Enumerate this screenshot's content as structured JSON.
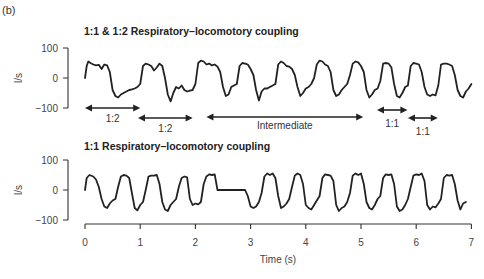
{
  "figure": {
    "panel_label": "(b)",
    "x_axis": {
      "label": "Time (s)",
      "ticks": [
        "0",
        "1",
        "2",
        "3",
        "4",
        "5",
        "6",
        "7"
      ],
      "range": [
        0,
        7
      ]
    }
  },
  "chart_data": [
    {
      "type": "line",
      "title": "1:1 & 1:2 Respiratory–locomotory coupling",
      "xlabel": "",
      "ylabel": "l/s",
      "xlim": [
        0,
        7
      ],
      "ylim": [
        -100,
        100
      ],
      "yticks": [
        "100",
        "0",
        "−100"
      ],
      "grid": false,
      "series": [
        {
          "name": "airflow",
          "x": [
            0.0,
            0.03,
            0.06,
            0.1,
            0.15,
            0.2,
            0.25,
            0.3,
            0.35,
            0.4,
            0.45,
            0.5,
            0.55,
            0.6,
            0.65,
            0.7,
            0.75,
            0.8,
            0.85,
            0.9,
            0.95,
            1.0,
            1.05,
            1.1,
            1.15,
            1.2,
            1.25,
            1.3,
            1.35,
            1.4,
            1.45,
            1.5,
            1.55,
            1.6,
            1.65,
            1.7,
            1.75,
            1.8,
            1.85,
            1.9,
            1.95,
            2.0,
            2.05,
            2.1,
            2.15,
            2.2,
            2.25,
            2.3,
            2.35,
            2.4,
            2.45,
            2.5,
            2.55,
            2.6,
            2.65,
            2.7,
            2.75,
            2.8,
            2.85,
            2.9,
            2.95,
            3.0,
            3.05,
            3.1,
            3.15,
            3.2,
            3.25,
            3.3,
            3.35,
            3.4,
            3.45,
            3.5,
            3.55,
            3.6,
            3.65,
            3.7,
            3.75,
            3.8,
            3.85,
            3.9,
            3.95,
            4.0,
            4.05,
            4.1,
            4.15,
            4.2,
            4.25,
            4.3,
            4.35,
            4.4,
            4.45,
            4.5,
            4.55,
            4.6,
            4.65,
            4.7,
            4.75,
            4.8,
            4.85,
            4.9,
            4.95,
            5.0,
            5.05,
            5.1,
            5.15,
            5.2,
            5.25,
            5.3,
            5.35,
            5.4,
            5.45,
            5.5,
            5.55,
            5.6,
            5.65,
            5.7,
            5.75,
            5.8,
            5.85,
            5.9,
            5.95,
            6.0,
            6.05,
            6.1,
            6.15,
            6.2,
            6.25,
            6.3,
            6.35,
            6.4,
            6.45,
            6.5,
            6.55,
            6.6,
            6.65,
            6.7,
            6.75,
            6.8,
            6.85,
            6.9,
            6.95,
            7.0
          ],
          "values": [
            0,
            40,
            55,
            50,
            45,
            42,
            44,
            30,
            45,
            42,
            20,
            -40,
            -60,
            -65,
            -55,
            -50,
            -45,
            -40,
            -38,
            -35,
            -30,
            -20,
            40,
            48,
            45,
            40,
            25,
            35,
            48,
            40,
            0,
            -55,
            -78,
            -50,
            -30,
            -35,
            -25,
            -40,
            -45,
            -42,
            -40,
            -20,
            50,
            58,
            55,
            45,
            48,
            42,
            45,
            38,
            20,
            -30,
            -60,
            -55,
            -30,
            -25,
            -20,
            40,
            50,
            48,
            45,
            30,
            10,
            -40,
            -75,
            -45,
            -35,
            -35,
            -30,
            -25,
            -20,
            45,
            55,
            50,
            40,
            38,
            30,
            10,
            -30,
            -60,
            -50,
            -35,
            -30,
            -20,
            0,
            45,
            58,
            55,
            45,
            40,
            20,
            -40,
            -60,
            -55,
            -40,
            -30,
            -20,
            10,
            48,
            55,
            52,
            40,
            20,
            -40,
            -65,
            -55,
            -40,
            -35,
            -10,
            48,
            50,
            48,
            35,
            -20,
            -60,
            -65,
            -50,
            -30,
            -25,
            40,
            50,
            48,
            45,
            20,
            -30,
            -55,
            -60,
            -55,
            -58,
            -25,
            45,
            48,
            48,
            45,
            40,
            10,
            -40,
            -60,
            -65,
            -45,
            -35,
            -20,
            45,
            55
          ]
        }
      ],
      "annotations": [
        {
          "label": "1:2",
          "x_start": 0.0,
          "x_end": 1.0
        },
        {
          "label": "1:2",
          "x_start": 0.96,
          "x_end": 1.95
        },
        {
          "label": "Intermediate",
          "x_start": 2.2,
          "x_end": 5.04
        },
        {
          "label": "1:1",
          "x_start": 5.29,
          "x_end": 5.84
        },
        {
          "label": "1:1",
          "x_start": 5.85,
          "x_end": 6.39
        }
      ]
    },
    {
      "type": "line",
      "title": "1:1 Respiratory–locomotory coupling",
      "xlabel": "Time (s)",
      "ylabel": "l/s",
      "xlim": [
        0,
        7
      ],
      "ylim": [
        -100,
        100
      ],
      "yticks": [
        "100",
        "0",
        "−100"
      ],
      "xticks": [
        "0",
        "1",
        "2",
        "3",
        "4",
        "5",
        "6",
        "7"
      ],
      "grid": false,
      "series": [
        {
          "name": "airflow",
          "x": [
            0.0,
            0.03,
            0.08,
            0.15,
            0.2,
            0.25,
            0.3,
            0.35,
            0.4,
            0.45,
            0.5,
            0.55,
            0.6,
            0.65,
            0.7,
            0.75,
            0.8,
            0.85,
            0.9,
            0.95,
            1.0,
            1.05,
            1.1,
            1.15,
            1.2,
            1.25,
            1.3,
            1.35,
            1.4,
            1.45,
            1.5,
            1.55,
            1.6,
            1.65,
            1.7,
            1.75,
            1.8,
            1.85,
            1.9,
            1.95,
            2.0,
            2.05,
            2.1,
            2.15,
            2.2,
            2.25,
            2.3,
            2.35,
            2.4,
            2.45,
            2.5,
            2.6,
            2.7,
            2.8,
            2.9,
            2.95,
            3.0,
            3.05,
            3.1,
            3.15,
            3.2,
            3.25,
            3.3,
            3.35,
            3.4,
            3.45,
            3.5,
            3.55,
            3.6,
            3.65,
            3.7,
            3.75,
            3.8,
            3.85,
            3.9,
            3.95,
            4.0,
            4.05,
            4.1,
            4.15,
            4.2,
            4.25,
            4.3,
            4.35,
            4.4,
            4.45,
            4.5,
            4.55,
            4.6,
            4.65,
            4.7,
            4.75,
            4.8,
            4.85,
            4.9,
            4.95,
            5.0,
            5.05,
            5.1,
            5.15,
            5.2,
            5.25,
            5.3,
            5.35,
            5.4,
            5.45,
            5.5,
            5.55,
            5.6,
            5.65,
            5.7,
            5.75,
            5.8,
            5.85,
            5.9,
            5.95,
            6.0,
            6.05,
            6.1,
            6.15,
            6.2,
            6.25,
            6.3,
            6.35,
            6.4,
            6.45,
            6.5,
            6.55,
            6.6,
            6.65,
            6.7,
            6.75,
            6.8,
            6.85,
            6.9,
            6.95
          ],
          "values": [
            0,
            40,
            50,
            45,
            35,
            10,
            -30,
            -55,
            -60,
            -45,
            -35,
            -30,
            10,
            45,
            50,
            48,
            40,
            -10,
            -60,
            -68,
            -50,
            -40,
            0,
            45,
            48,
            48,
            50,
            20,
            -40,
            -65,
            -70,
            -50,
            -40,
            -30,
            10,
            40,
            45,
            42,
            -30,
            -50,
            -45,
            -48,
            -40,
            20,
            45,
            52,
            50,
            52,
            0,
            0,
            0,
            0,
            0,
            0,
            0,
            -20,
            -55,
            -60,
            -55,
            -40,
            -10,
            45,
            55,
            50,
            55,
            40,
            -20,
            -60,
            -55,
            -45,
            -30,
            10,
            48,
            55,
            50,
            20,
            -50,
            -60,
            -65,
            -50,
            -35,
            -20,
            40,
            52,
            50,
            48,
            30,
            -50,
            -70,
            -60,
            -55,
            -40,
            -10,
            48,
            55,
            50,
            55,
            20,
            -40,
            -60,
            -65,
            -50,
            -30,
            -20,
            40,
            52,
            50,
            52,
            20,
            -55,
            -70,
            -65,
            -50,
            -30,
            10,
            48,
            52,
            50,
            55,
            30,
            -50,
            -65,
            -55,
            -58,
            -45,
            -30,
            40,
            50,
            48,
            50,
            20,
            -35,
            -65,
            -45,
            -40
          ]
        }
      ]
    }
  ]
}
